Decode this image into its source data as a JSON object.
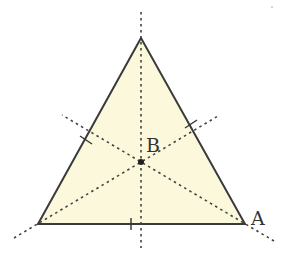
{
  "diagram": {
    "type": "equilateral-triangle-with-medians",
    "colors": {
      "fill": "#FBF8DC",
      "stroke": "#3a3a3a",
      "dashed": "#444444"
    },
    "vertices": {
      "top": {
        "x": 141,
        "y": 38
      },
      "bottom_left": {
        "x": 38,
        "y": 224
      },
      "bottom_right": {
        "x": 245,
        "y": 224
      }
    },
    "center": {
      "x": 141,
      "y": 162
    },
    "labels": {
      "center": "B",
      "bottom_right": "A"
    },
    "label_positions": {
      "B": {
        "x": 146,
        "y": 152
      },
      "A": {
        "x": 251,
        "y": 225
      }
    },
    "dashed_lines": [
      {
        "name": "vertical-median",
        "x1": 141,
        "y1": 12,
        "x2": 141,
        "y2": 248
      },
      {
        "name": "median-from-bottom-right",
        "x1": 274,
        "y1": 241,
        "x2": 62,
        "y2": 115
      },
      {
        "name": "median-from-bottom-left",
        "x1": 14,
        "y1": 238,
        "x2": 218,
        "y2": 116
      }
    ],
    "tick_marks": [
      {
        "name": "tick-left-side",
        "x": 86,
        "y": 140
      },
      {
        "name": "tick-right-side",
        "x": 191,
        "y": 124
      },
      {
        "name": "tick-bottom-side",
        "x": 131,
        "y": 224
      }
    ]
  }
}
